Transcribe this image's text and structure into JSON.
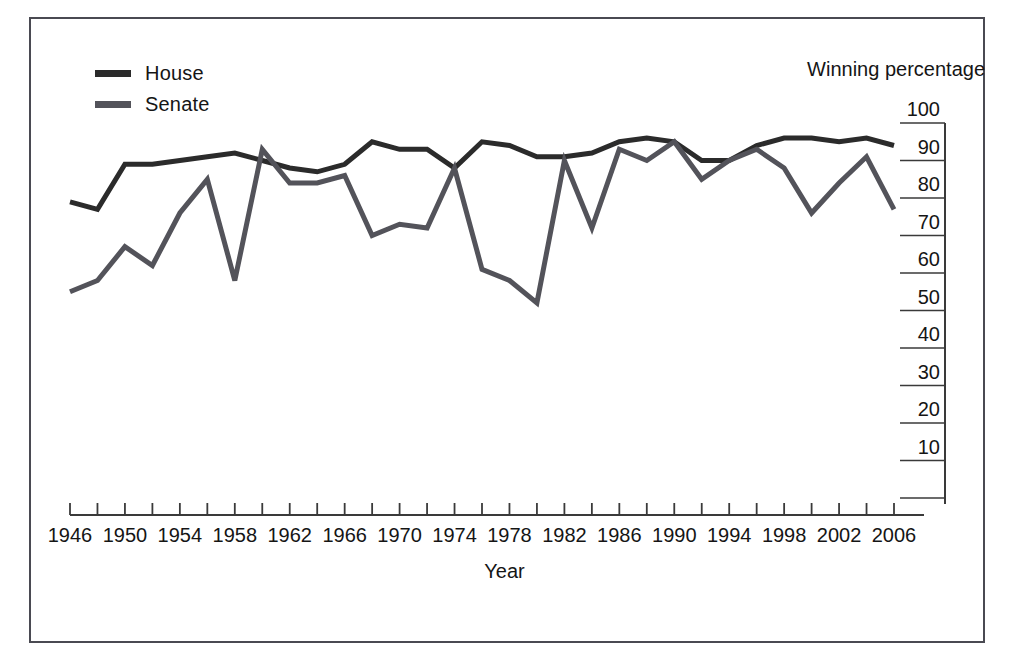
{
  "chart_data": {
    "type": "line",
    "title": "",
    "xlabel": "Year",
    "ylabel": "Winning percentage",
    "ylim": [
      0,
      100
    ],
    "xlim": [
      1946,
      2006
    ],
    "grid": false,
    "legend_position": "top-left",
    "y_ticks": [
      100,
      90,
      80,
      70,
      60,
      50,
      40,
      30,
      20,
      10
    ],
    "x_ticks": [
      1946,
      1948,
      1950,
      1952,
      1954,
      1956,
      1958,
      1960,
      1962,
      1964,
      1966,
      1968,
      1970,
      1972,
      1974,
      1976,
      1978,
      1980,
      1982,
      1984,
      1986,
      1988,
      1990,
      1992,
      1994,
      1996,
      1998,
      2000,
      2002,
      2004,
      2006
    ],
    "x_tick_labels": [
      "1946",
      "1950",
      "1954",
      "1958",
      "1962",
      "1966",
      "1970",
      "1974",
      "1978",
      "1982",
      "1986",
      "1990",
      "1994",
      "1998",
      "2002",
      "2006"
    ],
    "x": [
      1946,
      1948,
      1950,
      1952,
      1954,
      1956,
      1958,
      1960,
      1962,
      1964,
      1966,
      1968,
      1970,
      1972,
      1974,
      1976,
      1978,
      1980,
      1982,
      1984,
      1986,
      1988,
      1990,
      1992,
      1994,
      1996,
      1998,
      2000,
      2002,
      2004,
      2006
    ],
    "series": [
      {
        "name": "House",
        "color": "#2b2b2b",
        "values": [
          79,
          77,
          89,
          89,
          90,
          91,
          92,
          90,
          88,
          87,
          89,
          95,
          93,
          93,
          88,
          95,
          94,
          91,
          91,
          92,
          95,
          96,
          95,
          90,
          90,
          94,
          96,
          96,
          95,
          96,
          94
        ]
      },
      {
        "name": "Senate",
        "color": "#53535a",
        "values": [
          55,
          58,
          67,
          62,
          76,
          85,
          58,
          93,
          84,
          84,
          86,
          70,
          73,
          72,
          88,
          61,
          58,
          52,
          90,
          72,
          93,
          90,
          95,
          85,
          90,
          93,
          88,
          76,
          84,
          91,
          77
        ]
      }
    ]
  },
  "legend": {
    "items": [
      {
        "label": "House",
        "color": "#2b2b2b"
      },
      {
        "label": "Senate",
        "color": "#53535a"
      }
    ]
  },
  "axes": {
    "y_title": "Winning percentage",
    "x_title": "Year"
  }
}
